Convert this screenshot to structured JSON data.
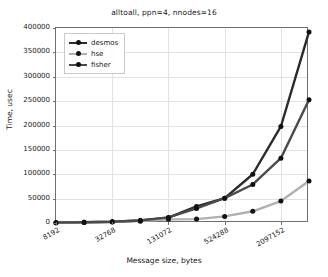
{
  "chart_data": {
    "type": "line",
    "title": "alltoall, ppn=4, nnodes=16",
    "xlabel": "Message size, bytes",
    "ylabel": "Time, usec",
    "grid": true,
    "legend_position": "upper left",
    "xscale": "log2",
    "xlim": [
      8192,
      4194304
    ],
    "ylim": [
      0,
      400000
    ],
    "x": [
      8192,
      16384,
      32768,
      65536,
      131072,
      262144,
      524288,
      1048576,
      2097152,
      4194304
    ],
    "xtick_labels": [
      "8192",
      "32768",
      "131072",
      "524288",
      "2097152"
    ],
    "xtick_values": [
      8192,
      32768,
      131072,
      524288,
      2097152
    ],
    "ytick_labels": [
      "0",
      "50000",
      "100000",
      "150000",
      "200000",
      "250000",
      "300000",
      "350000",
      "400000"
    ],
    "ytick_values": [
      0,
      50000,
      100000,
      150000,
      200000,
      250000,
      300000,
      350000,
      400000
    ],
    "series": [
      {
        "name": "desmos",
        "color": "#2b2b2b",
        "values": [
          700,
          1400,
          2600,
          5200,
          11000,
          34000,
          51000,
          100000,
          198000,
          392000
        ]
      },
      {
        "name": "hse",
        "color": "#b0b0b0",
        "values": [
          600,
          1100,
          2000,
          3800,
          7500,
          8000,
          13500,
          24000,
          45000,
          86000
        ]
      },
      {
        "name": "fisher",
        "color": "#4a4a4a",
        "values": [
          700,
          1400,
          2600,
          5200,
          11500,
          30000,
          51000,
          79000,
          133000,
          253000
        ]
      }
    ]
  }
}
